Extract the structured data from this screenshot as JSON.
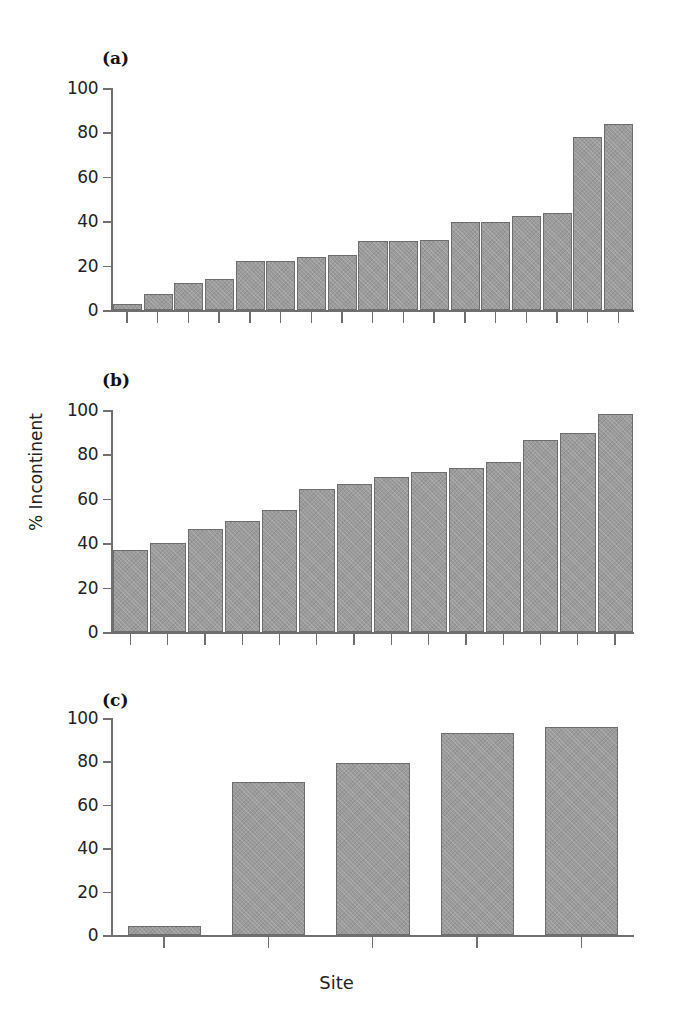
{
  "figure": {
    "xlabel": "Site",
    "ylabel": "% Incontinent",
    "panel_labels": {
      "a": "(a)",
      "b": "(b)",
      "c": "(c)"
    },
    "accent_color": "#9b9b9b",
    "axis_color": "#6f6f6f"
  },
  "chart_data": [
    {
      "type": "bar",
      "panel": "(a)",
      "title": "(a)",
      "xlabel": "Site",
      "ylabel": "% Incontinent",
      "ylim": [
        0,
        100
      ],
      "yticks": [
        0,
        20,
        40,
        60,
        80,
        100
      ],
      "ytick_labels": [
        "0",
        "20",
        "40",
        "60",
        "80",
        "100"
      ],
      "grid": false,
      "legend": "none",
      "categories": [
        "1",
        "2",
        "3",
        "4",
        "5",
        "6",
        "7",
        "8",
        "9",
        "10",
        "11",
        "12",
        "13",
        "14",
        "15",
        "16",
        "17"
      ],
      "values": [
        2.5,
        7,
        12,
        14,
        22,
        22,
        24,
        25,
        31,
        31,
        31.5,
        39.5,
        39.5,
        42.5,
        43.5,
        78,
        84
      ]
    },
    {
      "type": "bar",
      "panel": "(b)",
      "title": "(b)",
      "xlabel": "Site",
      "ylabel": "% Incontinent",
      "ylim": [
        0,
        100
      ],
      "yticks": [
        0,
        20,
        40,
        60,
        80,
        100
      ],
      "ytick_labels": [
        "0",
        "20",
        "40",
        "60",
        "80",
        "100"
      ],
      "grid": false,
      "legend": "none",
      "categories": [
        "1",
        "2",
        "3",
        "4",
        "5",
        "6",
        "7",
        "8",
        "9",
        "10",
        "11",
        "12",
        "13",
        "14"
      ],
      "values": [
        37,
        40,
        46.5,
        50,
        55,
        64.5,
        66.5,
        70,
        72,
        74,
        76.5,
        86.5,
        89.5,
        98
      ]
    },
    {
      "type": "bar",
      "panel": "(c)",
      "title": "(c)",
      "xlabel": "Site",
      "ylabel": "% Incontinent",
      "ylim": [
        0,
        100
      ],
      "yticks": [
        0,
        20,
        40,
        60,
        80,
        100
      ],
      "ytick_labels": [
        "0",
        "20",
        "40",
        "60",
        "80",
        "100"
      ],
      "grid": false,
      "legend": "none",
      "categories": [
        "1",
        "2",
        "3",
        "4",
        "5"
      ],
      "values": [
        4,
        70.5,
        79.5,
        93,
        96
      ]
    }
  ]
}
